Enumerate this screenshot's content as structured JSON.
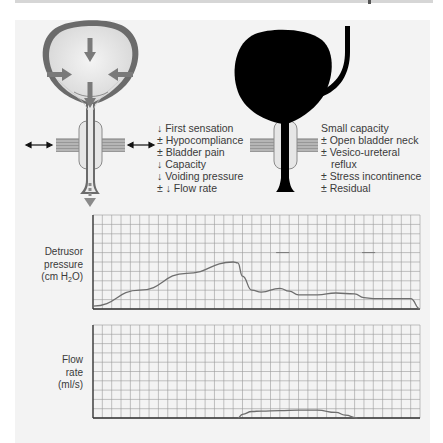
{
  "figure": {
    "left_diagram": {
      "description": "Bladder with detrusor contraction arrows, sphincter and pelvic floor",
      "findings": [
        "↓ First sensation",
        "± Hypocompliance",
        "± Bladder pain",
        "↓ Capacity",
        "↓ Voiding pressure",
        "± ↓ Flow rate"
      ]
    },
    "right_diagram": {
      "description": "Small contracted bladder (black) with refluxing ureter",
      "findings": [
        "Small capacity",
        "± Open bladder neck",
        "± Vesico-ureteral",
        "reflux",
        "± Stress incontinence",
        "± Residual"
      ]
    },
    "colors": {
      "panel_bg": "#f3f3f3",
      "bladder_wall": "#6b6b6b",
      "bladder_fill": "#e4e4e4",
      "arrow": "#7a7a7a",
      "grid": "#9a9a9a",
      "trace": "#6e6e6e",
      "black_bladder": "#000000"
    }
  },
  "chart_data": [
    {
      "type": "line",
      "title": "",
      "ylabel_lines": [
        "Detrusor",
        "pressure",
        "(cm H₂O)"
      ],
      "ylabel": "Detrusor pressure (cm H2O)",
      "xlabel": "",
      "grid": true,
      "grid_cols": 35,
      "grid_rows": 10,
      "x": [
        0,
        5,
        10,
        15,
        15.5,
        16,
        17,
        18,
        20,
        21,
        22,
        23,
        24,
        26,
        28,
        29,
        30,
        32,
        34,
        35
      ],
      "values": [
        0.3,
        2.0,
        3.8,
        5.0,
        4.9,
        3.5,
        2.0,
        1.8,
        2.2,
        1.9,
        1.5,
        1.5,
        1.5,
        1.7,
        1.6,
        1.2,
        1.1,
        1.1,
        1.1,
        0.0
      ],
      "annotations": [
        "short horizontal marks near row 6 at x≈20 and x≈29"
      ]
    },
    {
      "type": "line",
      "title": "",
      "ylabel_lines": [
        "Flow",
        "rate",
        "(ml/s)"
      ],
      "ylabel": "Flow rate (ml/s)",
      "xlabel": "",
      "grid": true,
      "grid_cols": 35,
      "grid_rows": 10,
      "x": [
        15.5,
        16,
        17,
        18,
        20,
        22,
        24,
        26,
        27,
        28.3
      ],
      "values": [
        0.0,
        0.4,
        0.7,
        0.75,
        0.8,
        0.85,
        0.85,
        0.6,
        0.3,
        0.0
      ]
    }
  ]
}
